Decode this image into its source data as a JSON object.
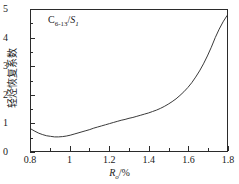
{
  "chart_data": {
    "type": "line",
    "title": "",
    "subtitle": "",
    "annotation": "C6-13/S1",
    "annotation_parts": {
      "base1": "C",
      "sub1": "6-13",
      "slash": "/",
      "base2": "S",
      "sub2": "1"
    },
    "xlabel": "Ro/%",
    "xlabel_parts": {
      "base": "R",
      "sub": "o",
      "unit": "/%"
    },
    "ylabel": "轻烃恢复系数",
    "xlim": [
      0.8,
      1.8
    ],
    "ylim": [
      0,
      5
    ],
    "grid": false,
    "legend": false,
    "legend_position": "none",
    "x_major_ticks": [
      0.8,
      1.0,
      1.2,
      1.4,
      1.6,
      1.8
    ],
    "x_major_tick_labels": [
      "0.8",
      "1",
      "1.2",
      "1.4",
      "1.6",
      "1.8"
    ],
    "x_minor_ticks": [
      0.9,
      1.1,
      1.3,
      1.5,
      1.7
    ],
    "y_major_ticks": [
      0,
      1,
      2,
      3,
      4,
      5
    ],
    "y_major_tick_labels": [
      "0",
      "1",
      "2",
      "3",
      "4",
      "5"
    ],
    "y_minor_ticks": [
      0.5,
      1.5,
      2.5,
      3.5,
      4.5
    ],
    "series": [
      {
        "name": "C6-13/S1",
        "color": "#3a3a3a",
        "x": [
          0.8,
          0.82,
          0.84,
          0.86,
          0.88,
          0.9,
          0.92,
          0.94,
          0.96,
          0.98,
          1.0,
          1.02,
          1.04,
          1.06,
          1.08,
          1.1,
          1.12,
          1.14,
          1.16,
          1.18,
          1.2,
          1.22,
          1.24,
          1.26,
          1.28,
          1.3,
          1.32,
          1.34,
          1.36,
          1.38,
          1.4,
          1.42,
          1.44,
          1.46,
          1.48,
          1.5,
          1.52,
          1.54,
          1.56,
          1.58,
          1.6,
          1.62,
          1.64,
          1.66,
          1.68,
          1.7,
          1.72,
          1.74,
          1.76,
          1.78,
          1.8
        ],
        "y": [
          0.78,
          0.7,
          0.63,
          0.58,
          0.54,
          0.52,
          0.5,
          0.5,
          0.51,
          0.53,
          0.56,
          0.6,
          0.64,
          0.68,
          0.72,
          0.76,
          0.81,
          0.85,
          0.89,
          0.93,
          0.97,
          1.01,
          1.05,
          1.09,
          1.12,
          1.16,
          1.19,
          1.23,
          1.27,
          1.31,
          1.35,
          1.4,
          1.45,
          1.51,
          1.58,
          1.66,
          1.75,
          1.85,
          1.97,
          2.1,
          2.25,
          2.42,
          2.62,
          2.84,
          3.09,
          3.37,
          3.68,
          4.02,
          4.32,
          4.58,
          4.8
        ]
      }
    ]
  }
}
